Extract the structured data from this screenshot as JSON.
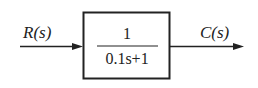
{
  "diagram": {
    "type": "block-diagram",
    "input_signal": "R(s)",
    "output_signal": "C(s)",
    "block": {
      "numerator": "1",
      "denominator": "0.1s+1"
    },
    "colors": {
      "stroke": "#222222",
      "background": "#ffffff"
    }
  }
}
